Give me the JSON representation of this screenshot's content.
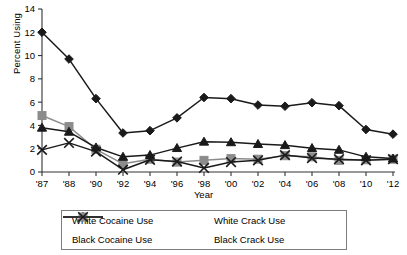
{
  "chart_data": {
    "type": "line",
    "title": "",
    "xlabel": "Year",
    "ylabel": "Percent Using",
    "ylim": [
      0,
      14
    ],
    "ytick_step": 2,
    "yticks": [
      0,
      2,
      4,
      6,
      8,
      10,
      12,
      14
    ],
    "grid": false,
    "legend_position": "bottom",
    "categories": [
      "'87",
      "'88",
      "'90",
      "'92",
      "'94",
      "'96",
      "'98",
      "'00",
      "'02",
      "'04",
      "'06",
      "'08",
      "'10",
      "'12"
    ],
    "series": [
      {
        "name": "White Cocaine Use",
        "marker": "diamond",
        "color": "#1a1a1a",
        "values": [
          12.0,
          9.7,
          6.3,
          3.35,
          3.55,
          4.65,
          6.4,
          6.3,
          5.75,
          5.65,
          5.95,
          5.7,
          3.65,
          3.25
        ]
      },
      {
        "name": "Black Cocaine Use",
        "marker": "square",
        "color": "#8c8c8c",
        "values": [
          4.85,
          3.9,
          1.95,
          0.7,
          1.1,
          0.85,
          1.0,
          1.15,
          1.1,
          1.4,
          1.3,
          1.0,
          1.05,
          1.1
        ]
      },
      {
        "name": "White Crack Use",
        "marker": "triangle",
        "color": "#1a1a1a",
        "values": [
          3.8,
          3.45,
          2.1,
          1.3,
          1.45,
          2.05,
          2.6,
          2.55,
          2.4,
          2.3,
          2.05,
          1.9,
          1.3,
          1.15
        ]
      },
      {
        "name": "Black Crack Use",
        "marker": "x",
        "color": "#1a1a1a",
        "values": [
          1.9,
          2.5,
          1.75,
          0.2,
          1.05,
          0.9,
          0.35,
          0.85,
          1.0,
          1.45,
          1.2,
          1.1,
          1.0,
          1.1
        ]
      }
    ]
  },
  "legend": {
    "items": [
      {
        "label": "White Cocaine Use",
        "marker": "diamond",
        "color": "#1a1a1a"
      },
      {
        "label": "White Crack Use",
        "marker": "triangle",
        "color": "#1a1a1a"
      },
      {
        "label": "Black Cocaine Use",
        "marker": "square",
        "color": "#8c8c8c"
      },
      {
        "label": "Black Crack Use",
        "marker": "x",
        "color": "#1a1a1a"
      }
    ]
  }
}
